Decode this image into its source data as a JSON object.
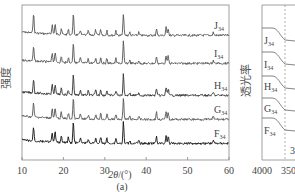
{
  "chart_data": [
    {
      "panel": "(a)",
      "type": "line",
      "title": "",
      "xlabel": "2θ/(°)",
      "ylabel": "强度",
      "xlim": [
        10,
        60
      ],
      "xticks": [
        10,
        20,
        30,
        40,
        50,
        60
      ],
      "grid": false,
      "legend_position": "inline-right",
      "series": [
        {
          "name": "J34",
          "label_main": "J",
          "label_sub": "34",
          "color": "#555555",
          "baseline_y": 35
        },
        {
          "name": "I34",
          "label_main": "I",
          "label_sub": "34",
          "color": "#555555",
          "baseline_y": 63
        },
        {
          "name": "H34",
          "label_main": "H",
          "label_sub": "34",
          "color": "#333333",
          "baseline_y": 95
        },
        {
          "name": "G34",
          "label_main": "G",
          "label_sub": "34",
          "color": "#555555",
          "baseline_y": 119
        },
        {
          "name": "F34",
          "label_main": "F",
          "label_sub": "34",
          "color": "#111111",
          "baseline_y": 143
        }
      ],
      "peaks_2theta": [
        12.8,
        17.3,
        18.0,
        19.5,
        21.2,
        22.4,
        24.1,
        26.0,
        27.8,
        29.0,
        30.5,
        32.7,
        34.5,
        36.0,
        38.2,
        42.5,
        44.8,
        45.3,
        56.2
      ]
    },
    {
      "panel": "(b)",
      "type": "line",
      "xlabel": "",
      "ylabel": "透光率",
      "xticks": [
        4000,
        3500
      ],
      "annotation": "3",
      "series": [
        {
          "name": "J34",
          "label_main": "J",
          "label_sub": "34"
        },
        {
          "name": "I34",
          "label_main": "I",
          "label_sub": "34"
        },
        {
          "name": "H34",
          "label_main": "H",
          "label_sub": "34"
        },
        {
          "name": "G34",
          "label_main": "G",
          "label_sub": "34"
        },
        {
          "name": "F34",
          "label_main": "F",
          "label_sub": "34"
        }
      ]
    }
  ],
  "panel_a": {
    "ylabel": "强度",
    "xlabel_main": "2θ",
    "xlabel_unit": "/(°)",
    "caption": "(a)",
    "xticks": [
      "10",
      "20",
      "30",
      "40",
      "50",
      "60"
    ]
  },
  "panel_b": {
    "ylabel": "透光率",
    "xticks": [
      "4000",
      "3500"
    ],
    "annotation": "3"
  }
}
